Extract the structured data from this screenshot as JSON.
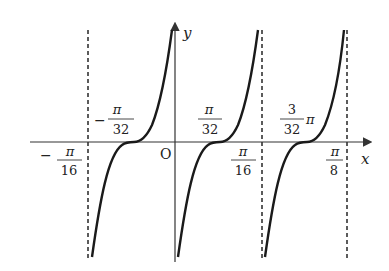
{
  "figure": {
    "colors": {
      "curve": "#1a1a1a",
      "axis": "#333333",
      "asymptote": "#333333",
      "background": "#ffffff"
    }
  },
  "axes": {
    "x_label": "x",
    "y_label": "y",
    "origin_label": "O"
  },
  "labels": {
    "neg_pi_32": {
      "sign": "−",
      "num": "π",
      "den": "32"
    },
    "neg_pi_16": {
      "sign": "−",
      "num": "π",
      "den": "16"
    },
    "pi_32": {
      "num": "π",
      "den": "32"
    },
    "pi_16": {
      "num": "π",
      "den": "16"
    },
    "three_pi_32": {
      "num": "3",
      "den": "32",
      "suffix": "π"
    },
    "pi_8": {
      "num": "π",
      "den": "8"
    }
  },
  "asymptotes": [
    "−π/16",
    "π/16",
    "π/8"
  ],
  "zeros": [
    "−π/32",
    "π/32",
    "3π/32"
  ]
}
